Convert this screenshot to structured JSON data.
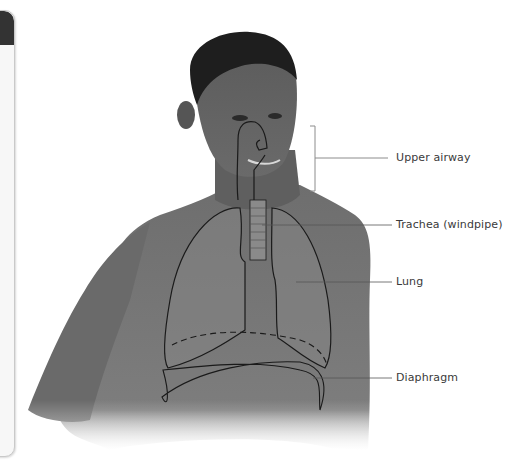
{
  "diagram": {
    "labels": [
      {
        "id": "upper-airway",
        "text": "Upper airway"
      },
      {
        "id": "trachea",
        "text": "Trachea (windpipe)"
      },
      {
        "id": "lung",
        "text": "Lung"
      },
      {
        "id": "diaphragm",
        "text": "Diaphragm"
      }
    ]
  },
  "side_panel": {
    "header_color": "#333333",
    "body_color": "#f7f7f7"
  }
}
